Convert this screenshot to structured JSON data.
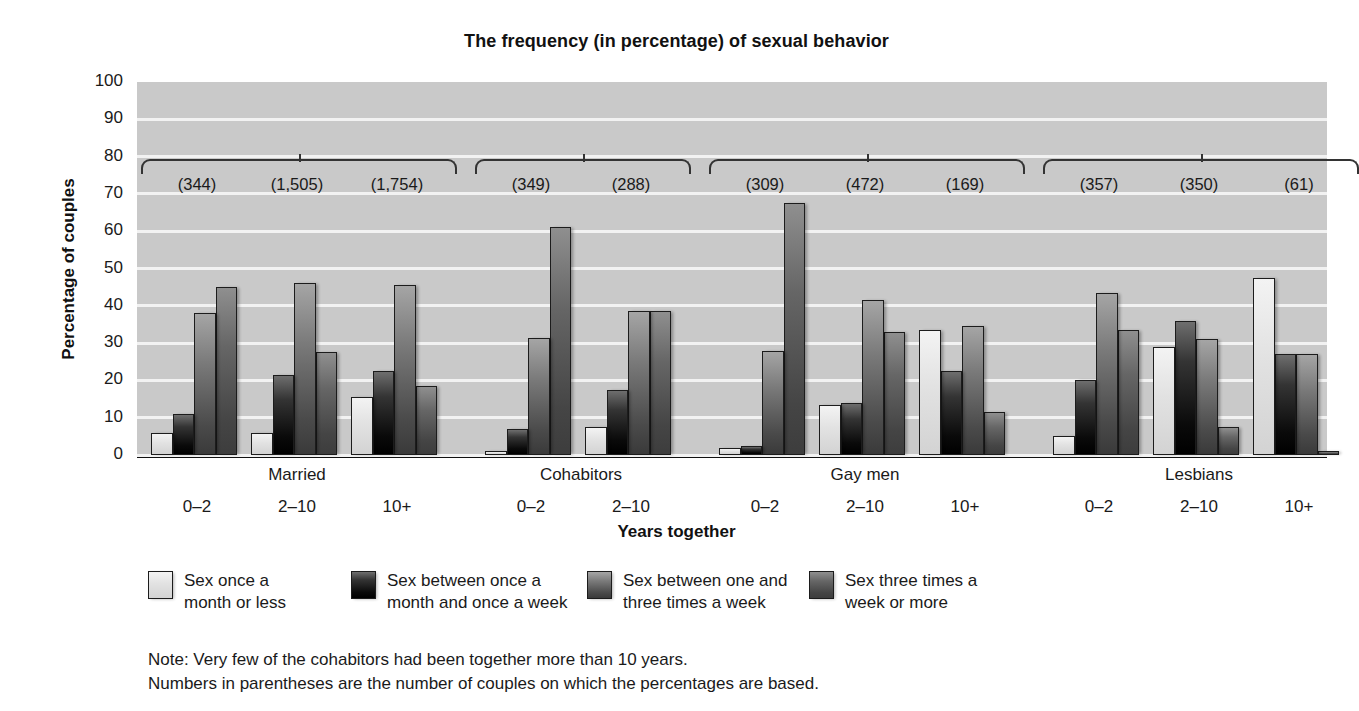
{
  "chart_data": {
    "type": "bar",
    "title": "The frequency (in percentage) of sexual behavior",
    "xlabel": "Years together",
    "ylabel": "Percentage of couples",
    "ylim": [
      0,
      100
    ],
    "ytick_labels": [
      "100",
      "90",
      "80",
      "70",
      "60",
      "50",
      "40",
      "30",
      "20",
      "10",
      "0"
    ],
    "grid": true,
    "legend_position": "below",
    "legend": [
      "Sex once a\nmonth or less",
      "Sex between once a\nmonth and once a week",
      "Sex between one and\nthree times a week",
      "Sex three times a\nweek or more"
    ],
    "series": [
      {
        "name": "Sex once a month or less",
        "color": "#e4e4e4",
        "values": [
          6,
          6,
          15.5,
          1,
          7.5,
          2,
          13.5,
          33.5,
          5,
          29,
          47.5
        ]
      },
      {
        "name": "Sex between once a month and once a week",
        "color": "#101010",
        "values": [
          11,
          21.5,
          22.5,
          7,
          17.5,
          2.5,
          14,
          22.5,
          20,
          36,
          27
        ]
      },
      {
        "name": "Sex between one and three times a week",
        "color": "#5e5e5e",
        "values": [
          38,
          46,
          45.5,
          31.5,
          38.5,
          28,
          41.5,
          34.5,
          43.5,
          31,
          27
        ]
      },
      {
        "name": "Sex three times a week or more",
        "color": "#4a4a4a",
        "values": [
          45,
          27.5,
          18.5,
          61,
          38.5,
          67.5,
          33,
          11.5,
          33.5,
          7.5,
          1
        ]
      }
    ],
    "categories": [
      "0–2",
      "2–10",
      "10+",
      "0–2",
      "2–10",
      "0–2",
      "2–10",
      "10+",
      "0–2",
      "2–10",
      "10+"
    ],
    "counts": [
      "(344)",
      "(1,505)",
      "(1,754)",
      "(349)",
      "(288)",
      "(309)",
      "(472)",
      "(169)",
      "(357)",
      "(350)",
      "(61)"
    ],
    "groups": [
      {
        "label": "Married",
        "categories": [
          "0–2",
          "2–10",
          "10+"
        ]
      },
      {
        "label": "Cohabitors",
        "categories": [
          "0–2",
          "2–10"
        ]
      },
      {
        "label": "Gay men",
        "categories": [
          "0–2",
          "2–10",
          "10+"
        ]
      },
      {
        "label": "Lesbians",
        "categories": [
          "0–2",
          "2–10",
          "10+"
        ]
      }
    ],
    "note": "Note: Very few of the cohabitors had been together more than 10 years.\nNumbers in parentheses are the number of couples on which the percentages are based."
  }
}
